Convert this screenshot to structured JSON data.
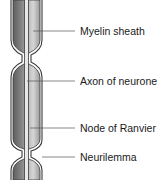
{
  "diagram": {
    "labels": [
      {
        "id": "myelin",
        "text": "Myelin sheath",
        "y": 31
      },
      {
        "id": "axon",
        "text": "Axon of neurone",
        "y": 81
      },
      {
        "id": "node",
        "text": "Node of Ranvier",
        "y": 128
      },
      {
        "id": "neurilemma",
        "text": "Neurilemma",
        "y": 157
      }
    ],
    "colors": {
      "sheath_dark": "#6e6e6e",
      "sheath_light": "#d8d8d8",
      "outline": "#3a3a3a",
      "leader": "#555555"
    }
  }
}
